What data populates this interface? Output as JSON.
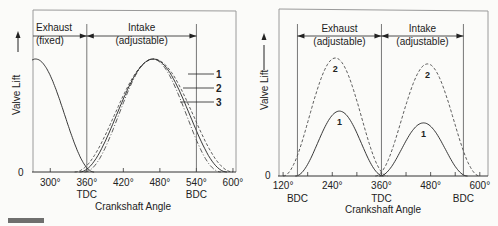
{
  "chart_data": [
    {
      "type": "line",
      "name": "fixed-exhaust-adjustable-intake",
      "ylabel": "Valve Lift",
      "xlabel": "Crankshaft Angle",
      "y_zero_label": "0",
      "xlim": [
        270,
        605
      ],
      "ticks": [
        300,
        360,
        420,
        480,
        540,
        600
      ],
      "tick_labels": [
        "300°",
        "360°",
        "420°",
        "480°",
        "540°",
        "600°"
      ],
      "markers": [
        {
          "x": 360,
          "label": "TDC"
        },
        {
          "x": 540,
          "label": "BDC"
        }
      ],
      "regions": [
        {
          "label1": "Exhaust",
          "label2": "(fixed)",
          "from": 270,
          "to": 360
        },
        {
          "label1": "Intake",
          "label2": "(adjustable)",
          "from": 360,
          "to": 540
        }
      ],
      "series": [
        {
          "name": "exhaust",
          "style": "solid",
          "start": 180,
          "end": 372,
          "peak": 1.0
        },
        {
          "name": "1",
          "style": "dash",
          "start": 340,
          "end": 600,
          "peak": 1.0
        },
        {
          "name": "2",
          "style": "solid",
          "start": 348,
          "end": 590,
          "peak": 1.0
        },
        {
          "name": "3",
          "style": "dashdot",
          "start": 356,
          "end": 580,
          "peak": 1.0
        }
      ],
      "legend": [
        "1",
        "2",
        "3"
      ]
    },
    {
      "type": "line",
      "name": "adjustable-exhaust-adjustable-intake",
      "ylabel": "Valve Lift",
      "xlabel": "Crankshaft Angle",
      "y_zero_label": "0",
      "xlim": [
        110,
        620
      ],
      "ticks": [
        120,
        240,
        360,
        480,
        600
      ],
      "minor_ticks": [
        180,
        300,
        420,
        540
      ],
      "tick_labels": [
        "120°",
        "240°",
        "360°",
        "480°",
        "600°"
      ],
      "markers": [
        {
          "x": 155,
          "label": "BDC"
        },
        {
          "x": 360,
          "label": "TDC"
        },
        {
          "x": 560,
          "label": "BDC"
        }
      ],
      "regions": [
        {
          "label1": "Exhaust",
          "label2": "(adjustable)",
          "from": 155,
          "to": 360
        },
        {
          "label1": "Intake",
          "label2": "(adjustable)",
          "from": 360,
          "to": 560
        }
      ],
      "series": [
        {
          "name": "2",
          "group": "exhaust",
          "style": "dash",
          "start": 120,
          "end": 375,
          "peak": 1.0
        },
        {
          "name": "1",
          "group": "exhaust",
          "style": "solid",
          "start": 150,
          "end": 365,
          "peak": 0.55
        },
        {
          "name": "2",
          "group": "intake",
          "style": "dash",
          "start": 345,
          "end": 600,
          "peak": 0.95
        },
        {
          "name": "1",
          "group": "intake",
          "style": "solid",
          "start": 355,
          "end": 570,
          "peak": 0.45
        }
      ]
    }
  ]
}
